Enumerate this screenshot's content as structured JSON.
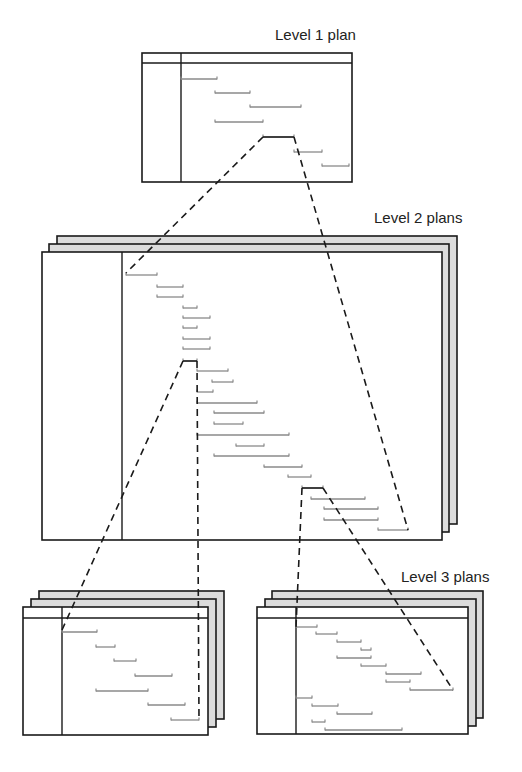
{
  "labels": {
    "level1": "Level 1 plan",
    "level2": "Level 2 plans",
    "level3": "Level 3 plans"
  },
  "colors": {
    "border": "#1a1a1a",
    "layer_fill": "#dcdcdc",
    "bar": "#8a8a8a",
    "dash": "#1a1a1a"
  },
  "plans": [
    {
      "id": "level1",
      "layers": [],
      "front": {
        "x": 142,
        "y": 53,
        "w": 210,
        "h": 129
      },
      "header_y": 63,
      "divider_x": 181,
      "bars": [
        [
          181,
          217,
          79
        ],
        [
          215,
          250,
          93
        ],
        [
          250,
          301,
          107
        ],
        [
          215,
          263,
          122
        ],
        [
          263,
          294,
          137
        ],
        [
          294,
          322,
          152
        ],
        [
          322,
          349,
          166
        ]
      ],
      "selected_bar": [
        263,
        294,
        137
      ]
    },
    {
      "id": "level2",
      "layers": [
        {
          "x": 57,
          "y": 236,
          "w": 400,
          "h": 288
        },
        {
          "x": 49,
          "y": 244,
          "w": 400,
          "h": 288
        }
      ],
      "front": {
        "x": 42,
        "y": 252,
        "w": 400,
        "h": 288
      },
      "header_y": null,
      "divider_x": 122,
      "bars": [
        [
          126,
          157,
          275
        ],
        [
          157,
          183,
          287
        ],
        [
          157,
          183,
          297
        ],
        [
          183,
          197,
          308
        ],
        [
          183,
          210,
          318
        ],
        [
          183,
          197,
          328
        ],
        [
          183,
          210,
          339
        ],
        [
          183,
          210,
          349
        ],
        [
          183,
          197,
          361
        ],
        [
          197,
          228,
          371
        ],
        [
          212,
          233,
          382
        ],
        [
          197,
          213,
          392
        ],
        [
          197,
          257,
          403
        ],
        [
          214,
          264,
          413
        ],
        [
          214,
          243,
          424
        ],
        [
          197,
          289,
          435
        ],
        [
          236,
          264,
          446
        ],
        [
          214,
          289,
          456
        ],
        [
          264,
          302,
          467
        ],
        [
          288,
          311,
          477
        ],
        [
          302,
          323,
          488
        ],
        [
          311,
          365,
          499
        ],
        [
          324,
          378,
          509
        ],
        [
          324,
          378,
          520
        ],
        [
          378,
          408,
          530
        ]
      ]
    },
    {
      "id": "level3-left",
      "layers": [
        {
          "x": 39,
          "y": 591,
          "w": 185,
          "h": 128
        },
        {
          "x": 31,
          "y": 599,
          "w": 185,
          "h": 128
        }
      ],
      "front": {
        "x": 23,
        "y": 607,
        "w": 185,
        "h": 128
      },
      "header_y": 618,
      "divider_x": 62,
      "bars": [
        [
          62,
          97,
          632
        ],
        [
          96,
          115,
          647
        ],
        [
          114,
          136,
          661
        ],
        [
          135,
          172,
          676
        ],
        [
          96,
          148,
          691
        ],
        [
          148,
          185,
          705
        ],
        [
          171,
          199,
          720
        ]
      ]
    },
    {
      "id": "level3-right",
      "layers": [
        {
          "x": 272,
          "y": 591,
          "w": 211,
          "h": 127
        },
        {
          "x": 265,
          "y": 599,
          "w": 211,
          "h": 127
        }
      ],
      "front": {
        "x": 257,
        "y": 607,
        "w": 211,
        "h": 127
      },
      "header_y": 618,
      "divider_x": 296,
      "bars": [
        [
          296,
          317,
          627
        ],
        [
          316,
          337,
          634
        ],
        [
          337,
          361,
          642
        ],
        [
          361,
          371,
          650
        ],
        [
          337,
          371,
          658
        ],
        [
          361,
          386,
          666
        ],
        [
          386,
          421,
          674
        ],
        [
          386,
          410,
          682
        ],
        [
          410,
          453,
          690
        ],
        [
          296,
          312,
          698
        ],
        [
          312,
          338,
          706
        ],
        [
          337,
          372,
          714
        ],
        [
          312,
          325,
          722
        ],
        [
          325,
          402,
          730
        ]
      ]
    }
  ],
  "connectors": [
    {
      "from": [
        263,
        137
      ],
      "to": [
        126,
        273
      ]
    },
    {
      "from": [
        294,
        137
      ],
      "to": [
        408,
        530
      ]
    },
    {
      "from": [
        183,
        361
      ],
      "to": [
        62,
        630
      ]
    },
    {
      "from": [
        197,
        361
      ],
      "to": [
        199,
        720
      ]
    },
    {
      "from": [
        302,
        488
      ],
      "to": [
        296,
        627
      ]
    },
    {
      "from": [
        323,
        488
      ],
      "to": [
        453,
        690
      ]
    }
  ]
}
